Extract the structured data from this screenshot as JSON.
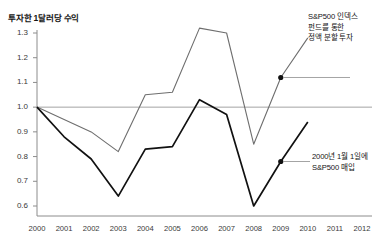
{
  "chart_data": {
    "type": "line",
    "title": "투자한 1달러당 수익",
    "xlabel": "",
    "ylabel": "",
    "x": [
      2000,
      2001,
      2002,
      2003,
      2004,
      2005,
      2006,
      2007,
      2008,
      2009,
      2010
    ],
    "xticks": [
      "2000",
      "2001",
      "2002",
      "2003",
      "2004",
      "2005",
      "2006",
      "2007",
      "2008",
      "2009",
      "2010",
      "2011",
      "2012"
    ],
    "yticks": [
      "1.3",
      "1.2",
      "1.1",
      "1.0",
      "0.9",
      "0.8",
      "0.7",
      "0.6"
    ],
    "xlim": [
      2000,
      2012
    ],
    "ylim": [
      0.55,
      1.34
    ],
    "grid": false,
    "reference_line": 1.0,
    "legend_position": "annotations",
    "series": [
      {
        "name": "S&P500 인덱스 펀드를 통한 정액 분할 투자",
        "color": "#6e6e6e",
        "values": [
          1.0,
          0.95,
          0.9,
          0.82,
          1.05,
          1.06,
          1.32,
          1.3,
          0.85,
          1.12,
          1.28
        ]
      },
      {
        "name": "2000년 1월 1일에 S&P500 매입",
        "color": "#111111",
        "values": [
          1.0,
          0.88,
          0.79,
          0.64,
          0.83,
          0.84,
          1.03,
          0.97,
          0.6,
          0.78,
          0.94
        ]
      }
    ],
    "annotations": [
      {
        "id": "dca",
        "lines": [
          "S&P500 인덱스",
          "펀드를 통한",
          "정액 분할 투자"
        ],
        "target_x": 2009,
        "target_y": 1.12
      },
      {
        "id": "lumpsum",
        "lines": [
          "2000년 1월 1일에",
          "S&P500 매입"
        ],
        "target_x": 2009,
        "target_y": 0.78
      }
    ]
  },
  "colors": {
    "axis": "#8c8c8c",
    "reference": "#9a9a9a",
    "series_gray": "#6e6e6e",
    "series_black": "#111111",
    "text": "#141414",
    "tick_text": "#3a3a3a",
    "background": "#ffffff"
  }
}
